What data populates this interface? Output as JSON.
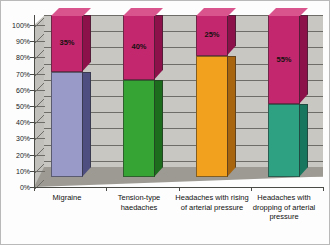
{
  "chart_data": {
    "type": "bar",
    "subtype": "stacked-100-percent-3d",
    "title": "",
    "xlabel": "",
    "ylabel": "",
    "ylim": [
      0,
      100
    ],
    "grid": true,
    "legend": "none",
    "categories": [
      "Migraine",
      "Tension-type haedaches",
      "Headaches with rising of arterial pressure",
      "Headaches with dropping of arterial pressure"
    ],
    "ytick_labels": [
      "0%",
      "10%",
      "20%",
      "30%",
      "40%",
      "50%",
      "60%",
      "70%",
      "80%",
      "90%",
      "100%"
    ],
    "ytick_values": [
      0,
      10,
      20,
      30,
      40,
      50,
      60,
      70,
      80,
      90,
      100
    ],
    "series": [
      {
        "name": "base",
        "values": [
          65,
          60,
          75,
          45
        ],
        "colors": [
          "#9a9ac8",
          "#35a435",
          "#f2a11e",
          "#2fa183"
        ],
        "side_colors": [
          "#4e4e80",
          "#1d6b1d",
          "#a8650d",
          "#16775e"
        ],
        "top_colors": [
          "#b4b4dc",
          "#5cc25c",
          "#ffbe4d",
          "#52bfa1"
        ],
        "labels": [
          "",
          "",
          "",
          ""
        ]
      },
      {
        "name": "magenta",
        "values": [
          35,
          40,
          25,
          55
        ],
        "colors": [
          "#c3276e",
          "#c3276e",
          "#c3276e",
          "#c3276e"
        ],
        "side_colors": [
          "#8c1049",
          "#8c1049",
          "#8c1049",
          "#8c1049"
        ],
        "top_colors": [
          "#d9548d",
          "#d9548d",
          "#d9548d",
          "#d9548d"
        ],
        "labels": [
          "35%",
          "40%",
          "25%",
          "55%"
        ]
      }
    ],
    "bar_value_labels": [
      "35%",
      "40%",
      "25%",
      "55%"
    ],
    "colors": {
      "migraine_base": "#9a9ac8",
      "tension_base": "#35a435",
      "rising_base": "#f2a11e",
      "dropping_base": "#2fa183",
      "top_segment": "#c3276e",
      "back_wall": "#c9c7c1",
      "floor": "#9c9a93",
      "gridline": "#6f6d68",
      "axis": "#4a4a46",
      "page_background": "#ffffff"
    }
  }
}
